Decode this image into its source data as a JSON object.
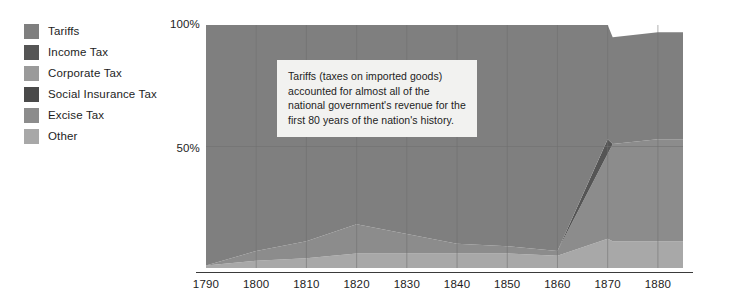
{
  "legend": {
    "position": "top-left",
    "items": [
      {
        "label": "Tariffs",
        "color": "#7f7f7f"
      },
      {
        "label": "Income Tax",
        "color": "#555555"
      },
      {
        "label": "Corporate Tax",
        "color": "#9a9a9a"
      },
      {
        "label": "Social Insurance Tax",
        "color": "#4a4a4a"
      },
      {
        "label": "Excise Tax",
        "color": "#8c8c8c"
      },
      {
        "label": "Other",
        "color": "#a8a8a8"
      }
    ]
  },
  "annotation": {
    "text": "Tariffs (taxes on imported goods) accounted for almost all of the national government's revenue for the first 80 years of the nation's history."
  },
  "axes": {
    "y_ticks": [
      "100%",
      "50%"
    ],
    "x_ticks": [
      "1790",
      "1800",
      "1810",
      "1820",
      "1830",
      "1840",
      "1850",
      "1860",
      "1870",
      "1880"
    ]
  },
  "chart_data": {
    "type": "area",
    "stacked": true,
    "title": "",
    "xlabel": "",
    "ylabel": "",
    "ylim": [
      0,
      100
    ],
    "xlim": [
      1790,
      1885
    ],
    "grid": true,
    "legend_position": "top-left",
    "annotations": [
      {
        "text": "Tariffs (taxes on imported goods) accounted for almost all of the national government's revenue for the first 80 years of the nation's history.",
        "x": 1812,
        "y": 78
      }
    ],
    "x": [
      1790,
      1800,
      1810,
      1820,
      1830,
      1840,
      1850,
      1860,
      1870,
      1871,
      1880,
      1885
    ],
    "series": [
      {
        "name": "Tariffs",
        "color": "#7f7f7f",
        "values": [
          99,
          93,
          89,
          82,
          86,
          90,
          91,
          93,
          47,
          44,
          44,
          44
        ]
      },
      {
        "name": "Income Tax",
        "color": "#555555",
        "values": [
          0,
          0,
          0,
          0,
          0,
          0,
          0,
          0,
          6,
          0,
          0,
          0
        ]
      },
      {
        "name": "Corporate Tax",
        "color": "#9a9a9a",
        "values": [
          0,
          0,
          0,
          0,
          0,
          0,
          0,
          0,
          0,
          0,
          0,
          0
        ]
      },
      {
        "name": "Social Insurance Tax",
        "color": "#4a4a4a",
        "values": [
          0,
          0,
          0,
          0,
          0,
          0,
          0,
          0,
          0,
          0,
          0,
          0
        ]
      },
      {
        "name": "Excise Tax",
        "color": "#8c8c8c",
        "values": [
          0,
          4,
          7,
          12,
          8,
          4,
          3,
          2,
          35,
          40,
          42,
          42
        ]
      },
      {
        "name": "Other",
        "color": "#a8a8a8",
        "values": [
          1,
          3,
          4,
          6,
          6,
          6,
          6,
          5,
          12,
          11,
          11,
          11
        ]
      }
    ]
  },
  "style": {
    "plot_background": "#f7f7f7",
    "gridline_color": "#6f6f6f",
    "axis_color": "#3a3a3a",
    "annotation_background": "#f2f2f0",
    "text_color": "#1d1d1d"
  }
}
